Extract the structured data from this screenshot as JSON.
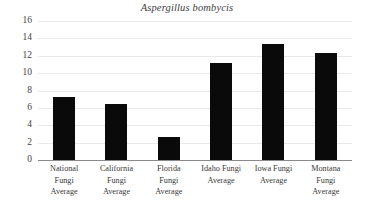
{
  "chart_data": {
    "type": "bar",
    "title": "Aspergillus bombycis",
    "xlabel": "",
    "ylabel": "",
    "categories": [
      "National Fungi Average",
      "California Fungi Average",
      "Florida Fungi Average",
      "Idaho Fungi Average",
      "Iowa Fungi Average",
      "Montana Fungi Average"
    ],
    "category_lines": [
      [
        "National",
        "Fungi",
        "Average"
      ],
      [
        "California",
        "Fungi",
        "Average"
      ],
      [
        "Florida",
        "Fungi",
        "Average"
      ],
      [
        "Idaho Fungi",
        "Average"
      ],
      [
        "Iowa Fungi",
        "Average"
      ],
      [
        "Montana",
        "Fungi",
        "Average"
      ]
    ],
    "values": [
      7.3,
      6.5,
      2.6,
      11.2,
      13.3,
      12.3
    ],
    "ylim": [
      0,
      16
    ],
    "ytick_labels": [
      "16",
      "14",
      "12",
      "10",
      "8",
      "6",
      "4",
      "2",
      "0"
    ],
    "ytick_values": [
      16,
      14,
      12,
      10,
      8,
      6,
      4,
      2,
      0
    ],
    "grid": true,
    "legend": false,
    "bar_color": "#0a0a0a",
    "gridline_color": "#e9e9e9",
    "axis_color": "#8a8a8a"
  }
}
